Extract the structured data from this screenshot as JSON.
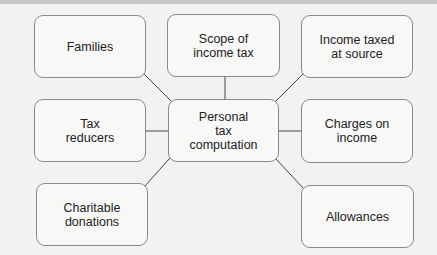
{
  "diagram": {
    "center": {
      "label": "Personal\ntax\ncomputation"
    },
    "nodes": [
      {
        "id": "families",
        "label": "Families"
      },
      {
        "id": "scope",
        "label": "Scope of\nincome tax"
      },
      {
        "id": "income-taxed-at-source",
        "label": "Income taxed\nat source"
      },
      {
        "id": "tax-reducers",
        "label": "Tax\nreducers"
      },
      {
        "id": "charges-on-income",
        "label": "Charges on\nincome"
      },
      {
        "id": "charitable-donations",
        "label": "Charitable\ndonations"
      },
      {
        "id": "allowances",
        "label": "Allowances"
      }
    ],
    "edges": [
      [
        "center",
        "families"
      ],
      [
        "center",
        "scope"
      ],
      [
        "center",
        "income-taxed-at-source"
      ],
      [
        "center",
        "tax-reducers"
      ],
      [
        "center",
        "charges-on-income"
      ],
      [
        "center",
        "charitable-donations"
      ],
      [
        "center",
        "allowances"
      ]
    ],
    "colors": {
      "border": "#8a8a8a",
      "background": "#f3f2f0",
      "box": "#f8f8f7",
      "text": "#222222"
    }
  }
}
